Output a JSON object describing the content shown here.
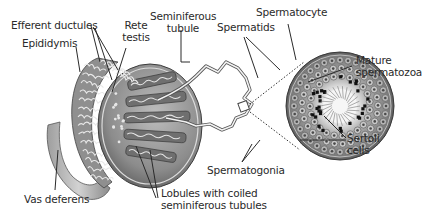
{
  "diagram": {
    "labels": {
      "efferent_ductules": "Efferent ductules",
      "epididymis": "Epididymis",
      "rete_testis_line1": "Rete",
      "rete_testis_line2": "testis",
      "seminiferous_tubule_line1": "Seminiferous",
      "seminiferous_tubule_line2": "tubule",
      "spermatocyte": "Spermatocyte",
      "spermatids": "Spermatids",
      "mature_spermatozoa_line1": "Mature",
      "mature_spermatozoa_line2": "spermatozoa",
      "sertoli_cells_line1": "Sertoli",
      "sertoli_cells_line2": "cells",
      "spermatogonia": "Spermatogonia",
      "lobules_line1": "Lobules with coiled",
      "lobules_line2": "seminiferous tubules",
      "vas_deferens": "Vas deferens"
    },
    "colors": {
      "ink": "#2a2a2a",
      "tissue_dark": "#6d6d6d",
      "tissue_mid": "#9a9a9a",
      "tissue_light": "#cfcfcf",
      "lumen": "#f4f4f4"
    }
  }
}
